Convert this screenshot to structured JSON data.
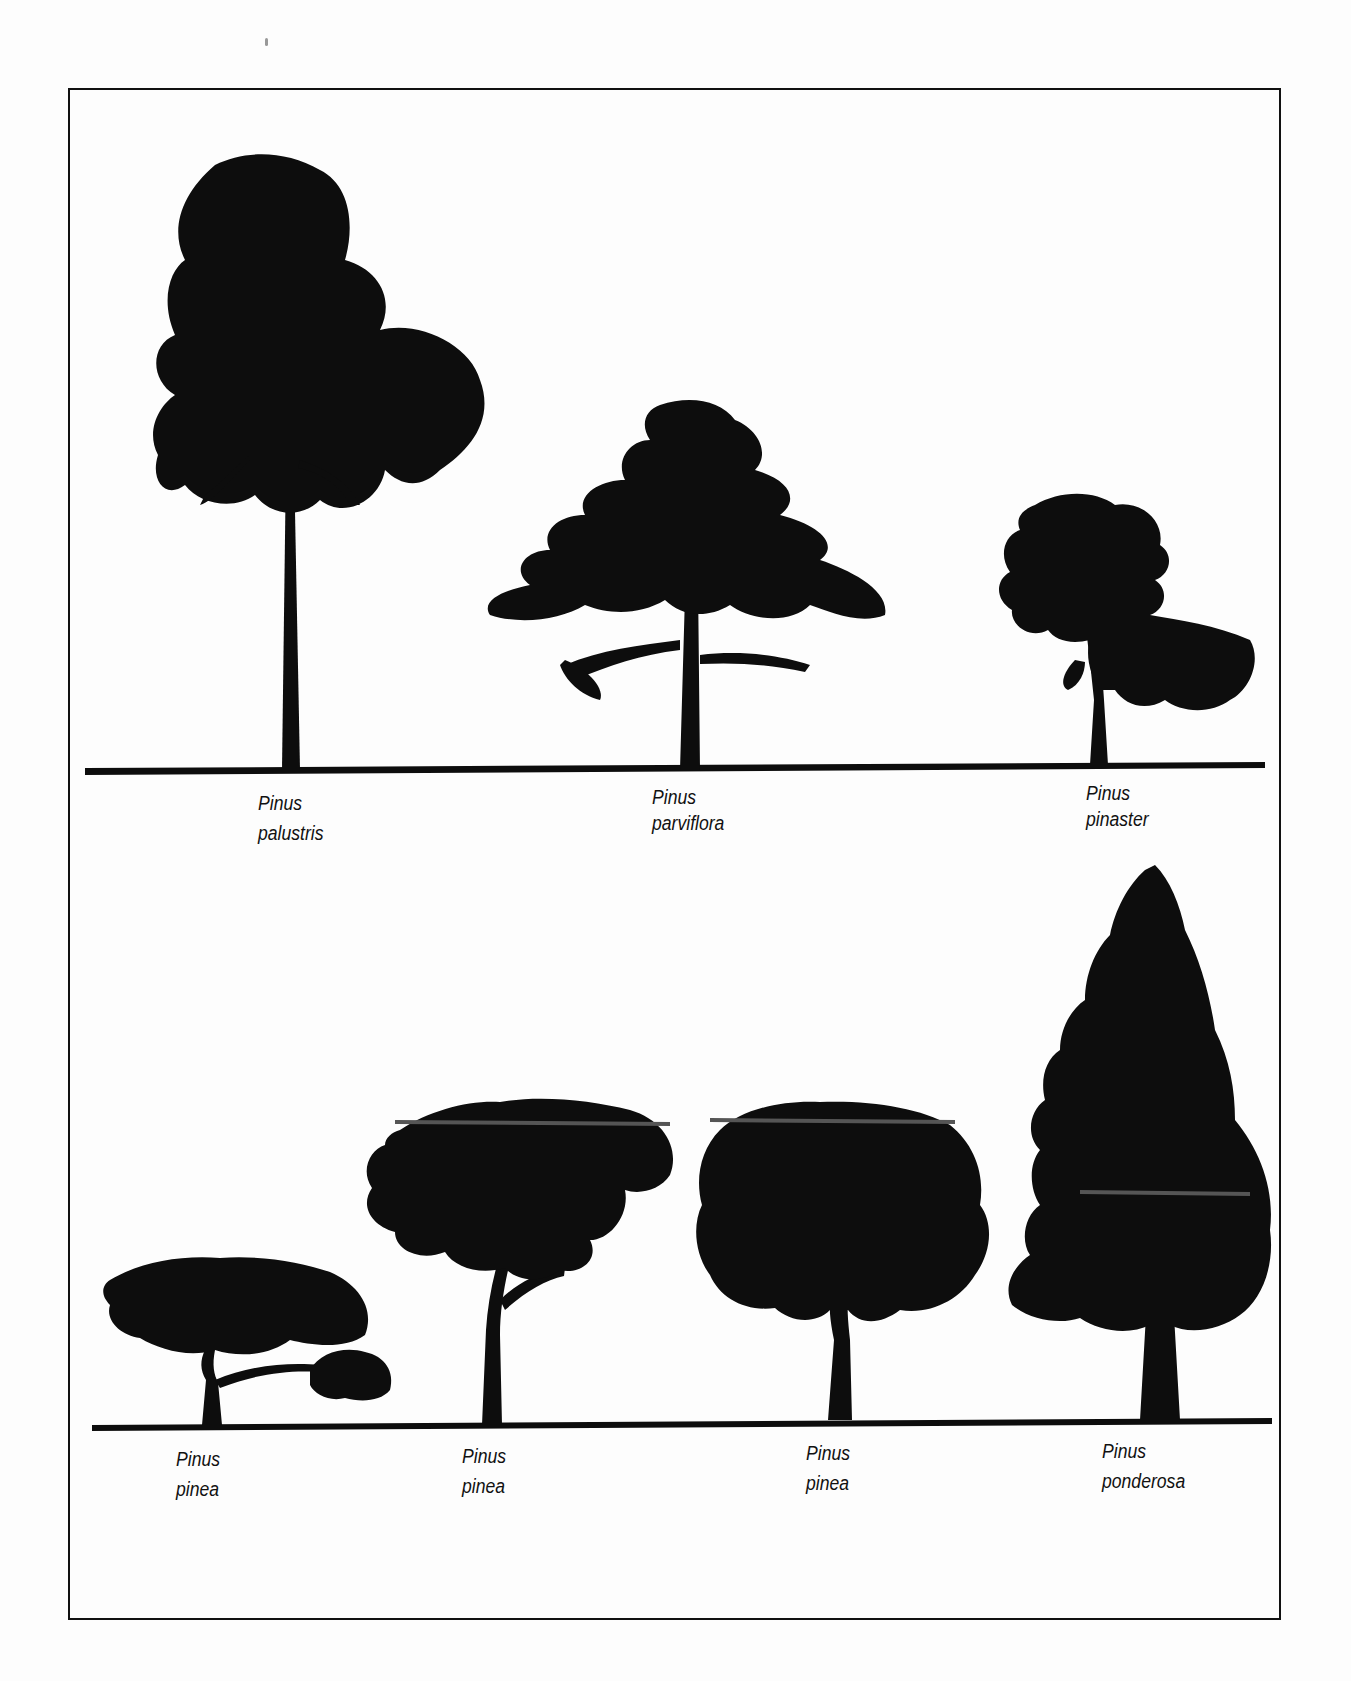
{
  "figure": {
    "top_row": [
      {
        "genus": "Pinus",
        "species": "palustris"
      },
      {
        "genus": "Pinus",
        "species": "parviflora"
      },
      {
        "genus": "Pinus",
        "species": "pinaster"
      }
    ],
    "bottom_row": [
      {
        "genus": "Pinus",
        "species": "pinea"
      },
      {
        "genus": "Pinus",
        "species": "pinea"
      },
      {
        "genus": "Pinus",
        "species": "pinea"
      },
      {
        "genus": "Pinus",
        "species": "ponderosa"
      }
    ],
    "colors": {
      "silhouette": "#0d0d0d",
      "background": "#fdfdfd",
      "frame": "#111111"
    }
  }
}
